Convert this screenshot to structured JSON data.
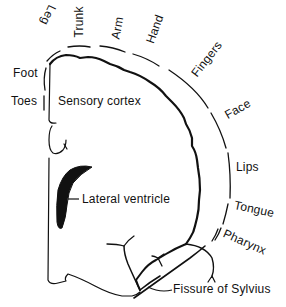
{
  "diagram": {
    "type": "anatomical-schematic",
    "colors": {
      "line": "#111111",
      "ventricle_fill": "#111111",
      "background": "#ffffff"
    }
  },
  "labels": {
    "leg": "Leg",
    "trunk": "Trunk",
    "arm": "Arm",
    "hand": "Hand",
    "fingers": "Fingers",
    "face": "Face",
    "lips": "Lips",
    "tongue": "Tongue",
    "pharynx": "Pharynx",
    "foot": "Foot",
    "toes": "Toes",
    "sensory_cortex": "Sensory cortex",
    "lateral_ventricle": "Lateral ventricle",
    "fissure_of_sylvius": "Fissure of Sylvius"
  }
}
